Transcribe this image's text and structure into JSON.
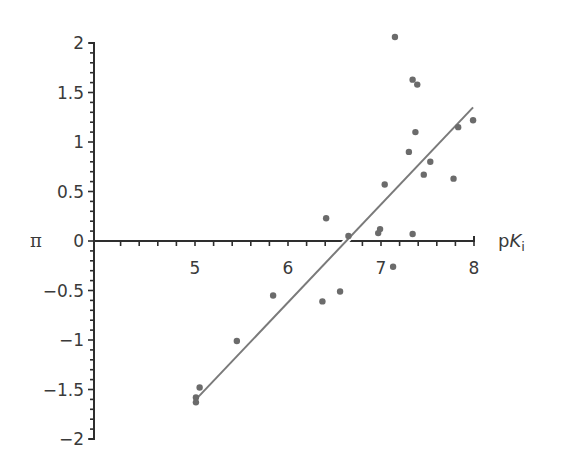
{
  "chart_data": {
    "type": "scatter",
    "title": "",
    "xlabel": "pK_i",
    "xlabel_parts": {
      "prefix": "p",
      "italic": "K",
      "subscript": "i"
    },
    "ylabel": "π",
    "xlim": [
      3.93,
      8.0
    ],
    "ylim": [
      -2,
      2
    ],
    "x_ticks": [
      5,
      6,
      7,
      8
    ],
    "x_tick_labels": [
      "5",
      "6",
      "7",
      "8"
    ],
    "x_minor_tick_step": 0.2,
    "y_ticks": [
      2,
      1.5,
      1,
      0.5,
      0,
      -0.5,
      -1,
      -1.5,
      -2
    ],
    "y_tick_labels": [
      "2",
      "1.5",
      "1",
      "0.5",
      "0",
      "−0.5",
      "−1",
      "−1.5",
      "−2"
    ],
    "y_minor_tick_step": 0.1,
    "grid": false,
    "legend": null,
    "series": [
      {
        "name": "compounds",
        "type": "scatter",
        "color": "#6b6b6b",
        "points": [
          {
            "x": 7.15,
            "y": 2.06
          },
          {
            "x": 7.34,
            "y": 1.63
          },
          {
            "x": 7.39,
            "y": 1.58
          },
          {
            "x": 7.37,
            "y": 1.1
          },
          {
            "x": 7.83,
            "y": 1.15
          },
          {
            "x": 7.99,
            "y": 1.22
          },
          {
            "x": 7.3,
            "y": 0.9
          },
          {
            "x": 7.53,
            "y": 0.8
          },
          {
            "x": 7.46,
            "y": 0.67
          },
          {
            "x": 7.78,
            "y": 0.63
          },
          {
            "x": 7.04,
            "y": 0.57
          },
          {
            "x": 6.41,
            "y": 0.23
          },
          {
            "x": 6.65,
            "y": 0.05
          },
          {
            "x": 6.99,
            "y": 0.12
          },
          {
            "x": 6.97,
            "y": 0.08
          },
          {
            "x": 7.34,
            "y": 0.07
          },
          {
            "x": 7.13,
            "y": -0.26
          },
          {
            "x": 5.84,
            "y": -0.55
          },
          {
            "x": 6.37,
            "y": -0.61
          },
          {
            "x": 6.56,
            "y": -0.51
          },
          {
            "x": 5.45,
            "y": -1.01
          },
          {
            "x": 5.05,
            "y": -1.48
          },
          {
            "x": 5.01,
            "y": -1.58
          },
          {
            "x": 5.01,
            "y": -1.63
          }
        ]
      },
      {
        "name": "regression line",
        "type": "line",
        "color": "#7a7a7a",
        "points": [
          {
            "x": 5.0,
            "y": -1.61
          },
          {
            "x": 7.99,
            "y": 1.35
          }
        ]
      }
    ],
    "colors": {
      "axis": "#2e2e2e",
      "text": "#3a3a3a",
      "points": "#6b6b6b",
      "line": "#7a7a7a"
    }
  }
}
